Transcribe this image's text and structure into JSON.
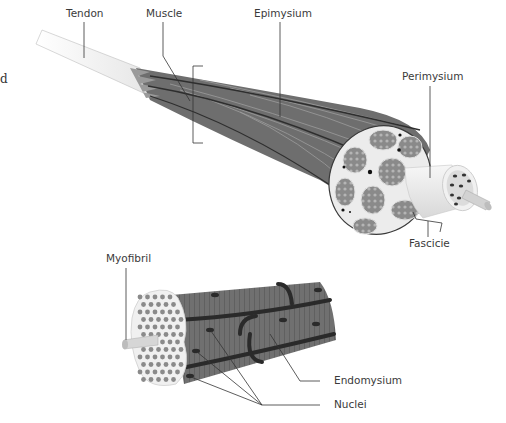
{
  "figure": {
    "cut_off_text": "d",
    "upper_diagram": {
      "labels": {
        "tendon": "Tendon",
        "muscle": "Muscle",
        "epimysium": "Epimysium",
        "perimysium": "Perimysium",
        "fascicle": "Fascicie"
      }
    },
    "lower_diagram": {
      "labels": {
        "myofibril": "Myofibril",
        "endomysium": "Endomysium",
        "nuclei": "Nuclei"
      }
    },
    "colors": {
      "muscle_body": "#6e6e6e",
      "muscle_dark_band": "#2e2e2e",
      "tendon": "#f2f2f2",
      "fascicle_fill": "#7a7a7a",
      "perimysium_fill": "#eeeeee",
      "leader_line": "#333333",
      "label_text": "#3a3a3a"
    }
  }
}
